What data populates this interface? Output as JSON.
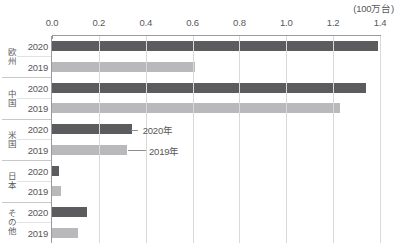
{
  "chart_data": {
    "type": "bar",
    "orientation": "horizontal",
    "title": "",
    "unit_caption": "(100万台)",
    "xlabel": "",
    "ylabel": "",
    "xlim": [
      0.0,
      1.4
    ],
    "xticks": [
      "0.0",
      "0.2",
      "0.4",
      "0.6",
      "0.8",
      "1.0",
      "1.2",
      "1.4"
    ],
    "xtick_values": [
      0.0,
      0.2,
      0.4,
      0.6,
      0.8,
      1.0,
      1.2,
      1.4
    ],
    "grid": true,
    "legend": "annotated",
    "categories": [
      "欧州",
      "中国",
      "米国",
      "日本",
      "その他"
    ],
    "series": [
      {
        "name": "2020",
        "color": "#5c5c5e",
        "values": [
          1.39,
          1.34,
          0.34,
          0.03,
          0.15
        ]
      },
      {
        "name": "2019",
        "color": "#b9b9bb",
        "values": [
          0.61,
          1.23,
          0.32,
          0.04,
          0.11
        ]
      }
    ],
    "annotations": [
      {
        "text": "2020年",
        "target_series": "2020",
        "target_category": "米国"
      },
      {
        "text": "2019年",
        "target_series": "2019",
        "target_category": "米国"
      }
    ]
  },
  "colors": {
    "bar_2020": "#5c5c5e",
    "bar_2019": "#b9b9bb",
    "axis": "#9a9a9a",
    "grid": "#d9d9d9",
    "text": "#58585a",
    "background": "#ffffff"
  },
  "rows": [
    {
      "category": "欧州",
      "year_2020": "2020",
      "year_2019": "2019"
    },
    {
      "category": "中国",
      "year_2020": "2020",
      "year_2019": "2019"
    },
    {
      "category": "米国",
      "year_2020": "2020",
      "year_2019": "2019"
    },
    {
      "category": "日本",
      "year_2020": "2020",
      "year_2019": "2019"
    },
    {
      "category": "その他",
      "year_2020": "2020",
      "year_2019": "2019"
    }
  ]
}
